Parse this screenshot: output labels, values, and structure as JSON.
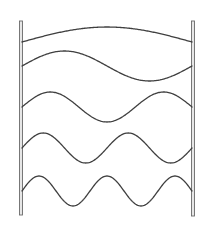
{
  "diagram": {
    "type": "standing-waves-between-fixed-walls",
    "canvas": {
      "width": 210,
      "height": 230
    },
    "colors": {
      "wave_stroke": "#3f3f3f",
      "wall_stroke": "#6a6a6a",
      "wall_fill": "#e6e6e6",
      "background": "#ffffff"
    },
    "walls": [
      {
        "id": "left-wall",
        "x": 19.5,
        "y_top": 21,
        "y_bottom": 215,
        "width": 3
      },
      {
        "id": "right-wall",
        "x": 191.5,
        "y_top": 21,
        "y_bottom": 216,
        "width": 3
      }
    ],
    "waves": [
      {
        "id": "wave-1",
        "harmonic": 1,
        "half_wavelengths": 1,
        "baseline_y": 42,
        "amplitude": 15,
        "x_start": 22,
        "x_end": 192
      },
      {
        "id": "wave-2",
        "harmonic": 2,
        "half_wavelengths": 2,
        "baseline_y": 66,
        "amplitude": 15,
        "x_start": 22,
        "x_end": 192
      },
      {
        "id": "wave-3",
        "harmonic": 3,
        "half_wavelengths": 3,
        "baseline_y": 107,
        "amplitude": 15,
        "x_start": 22,
        "x_end": 192
      },
      {
        "id": "wave-4",
        "harmonic": 4,
        "half_wavelengths": 4,
        "baseline_y": 148,
        "amplitude": 15,
        "x_start": 22,
        "x_end": 192
      },
      {
        "id": "wave-5",
        "harmonic": 5,
        "half_wavelengths": 5,
        "baseline_y": 191,
        "amplitude": 15,
        "x_start": 22,
        "x_end": 192
      }
    ]
  }
}
